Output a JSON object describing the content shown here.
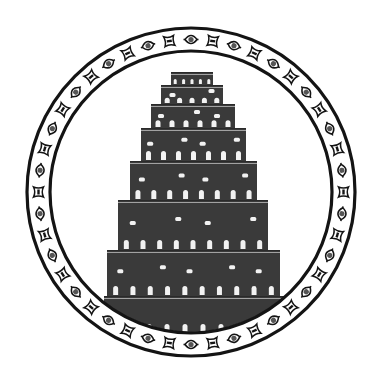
{
  "image": {
    "subject": "Tower of Babel emblem",
    "description": "Stepped ziggurat tower inside a circular ornamental border",
    "width": 383,
    "height": 386
  },
  "colors": {
    "background": "#ffffff",
    "ink": "#141414",
    "tower_fill": "#3a3a3a",
    "tower_dark": "#2a2a2a",
    "window": "#f2f2f2",
    "ornament_dot": "#555555"
  },
  "emblem": {
    "center": [
      191,
      192
    ],
    "outer_ring_radius": 164,
    "inner_ring_radius": 141,
    "ring_stroke": 3.2,
    "ornament_count": 44
  },
  "tower": {
    "tiers": [
      {
        "y0": 72,
        "y1": 85,
        "x0": 171,
        "x1": 213,
        "windows_bottom": 5,
        "windows_mid": 0
      },
      {
        "y0": 85,
        "y1": 104,
        "x0": 161,
        "x1": 223,
        "windows_bottom": 5,
        "windows_mid": 2
      },
      {
        "y0": 104,
        "y1": 128,
        "x0": 151,
        "x1": 235,
        "windows_bottom": 6,
        "windows_mid": 3
      },
      {
        "y0": 128,
        "y1": 161,
        "x0": 141,
        "x1": 246,
        "windows_bottom": 7,
        "windows_mid": 4
      },
      {
        "y0": 161,
        "y1": 200,
        "x0": 130,
        "x1": 257,
        "windows_bottom": 8,
        "windows_mid": 4
      },
      {
        "y0": 200,
        "y1": 250,
        "x0": 118,
        "x1": 268,
        "windows_bottom": 9,
        "windows_mid": 4
      },
      {
        "y0": 250,
        "y1": 296,
        "x0": 107,
        "x1": 280,
        "windows_bottom": 10,
        "windows_mid": 5
      },
      {
        "y0": 296,
        "y1": 334,
        "x0": 104,
        "x1": 284,
        "windows_bottom": 10,
        "windows_mid": 0
      }
    ]
  }
}
